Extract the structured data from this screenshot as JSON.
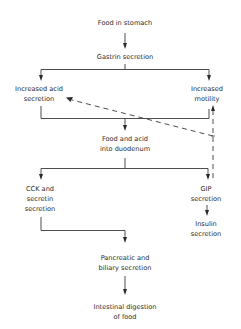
{
  "diagram": {
    "type": "flowchart",
    "nodes": {
      "food_in_stomach": "Food in stomach",
      "gastrin": "Gastrin secretion",
      "acid_1": "Increased acid",
      "acid_2": "secretion",
      "motility_1": "Increased",
      "motility_2": "motility",
      "duodenum_1": "Food and acid",
      "duodenum_2": "into duodenum",
      "cck_1": "CCK and",
      "cck_2": "secretin",
      "cck_3": "secretion",
      "gip_1": "GIP",
      "gip_2": "secretion",
      "insulin_1": "Insulin",
      "insulin_2": "secretion",
      "pancreatic_1": "Pancreatic and",
      "pancreatic_2": "biliary secretion",
      "digestion_1": "Intestinal digestion",
      "digestion_2": "of food"
    },
    "edges": [
      {
        "from": "Food in stomach",
        "to": "Gastrin secretion",
        "style": "solid"
      },
      {
        "from": "Gastrin secretion",
        "to": "Increased acid secretion",
        "style": "solid"
      },
      {
        "from": "Gastrin secretion",
        "to": "Increased motility",
        "style": "solid"
      },
      {
        "from": "Increased acid secretion",
        "to": "Food and acid into duodenum",
        "style": "solid"
      },
      {
        "from": "Increased motility",
        "to": "Food and acid into duodenum",
        "style": "solid"
      },
      {
        "from": "Food and acid into duodenum",
        "to": "CCK and secretin secretion",
        "style": "solid"
      },
      {
        "from": "Food and acid into duodenum",
        "to": "GIP secretion",
        "style": "solid"
      },
      {
        "from": "GIP secretion",
        "to": "Increased motility",
        "style": "dashed",
        "meaning": "inhibits"
      },
      {
        "from": "GIP secretion",
        "to": "Increased acid secretion",
        "style": "dashed",
        "meaning": "inhibits"
      },
      {
        "from": "GIP secretion",
        "to": "Insulin secretion",
        "style": "solid"
      },
      {
        "from": "CCK and secretin secretion",
        "to": "Pancreatic and biliary secretion",
        "style": "solid"
      },
      {
        "from": "Pancreatic and biliary secretion",
        "to": "Intestinal digestion of food",
        "style": "solid"
      }
    ]
  }
}
